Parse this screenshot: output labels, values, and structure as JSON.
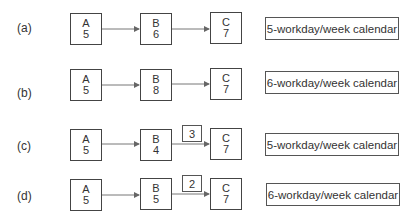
{
  "rows": [
    {
      "label": "(a)",
      "nodes": [
        {
          "name": "A",
          "duration": "5"
        },
        {
          "name": "B",
          "duration": "6"
        },
        {
          "name": "C",
          "duration": "7"
        }
      ],
      "lag": null,
      "calendar": "5-workday/week calendar"
    },
    {
      "label": "(b)",
      "nodes": [
        {
          "name": "A",
          "duration": "5"
        },
        {
          "name": "B",
          "duration": "8"
        },
        {
          "name": "C",
          "duration": "7"
        }
      ],
      "lag": null,
      "calendar": "6-workday/week calendar"
    },
    {
      "label": "(c)",
      "nodes": [
        {
          "name": "A",
          "duration": "5"
        },
        {
          "name": "B",
          "duration": "4"
        },
        {
          "name": "C",
          "duration": "7"
        }
      ],
      "lag": "3",
      "calendar": "5-workday/week calendar"
    },
    {
      "label": "(d)",
      "nodes": [
        {
          "name": "A",
          "duration": "5"
        },
        {
          "name": "B",
          "duration": "5"
        },
        {
          "name": "C",
          "duration": "7"
        }
      ],
      "lag": "2",
      "calendar": "6-workday/week calendar"
    }
  ],
  "colors": {
    "line": "#555555",
    "box_border": "#444444",
    "text": "#333333"
  }
}
